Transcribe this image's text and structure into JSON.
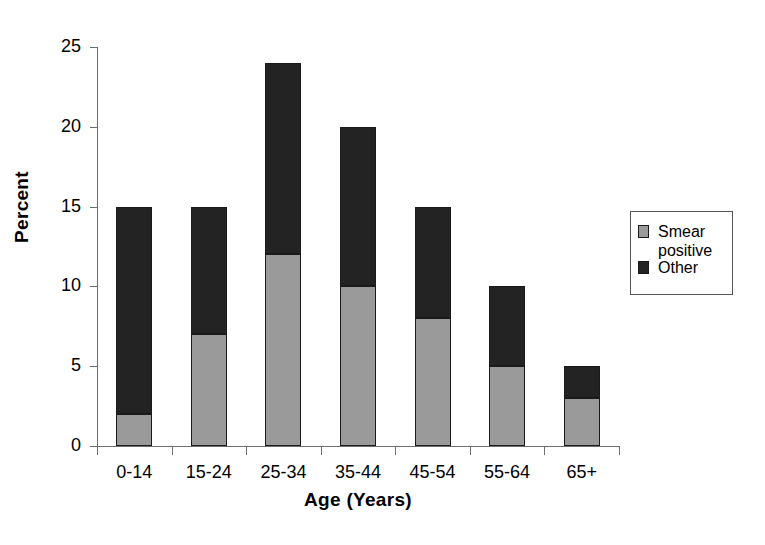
{
  "chart_data": {
    "type": "bar",
    "subtype": "stacked-vertical",
    "title": "",
    "xlabel": "Age (Years)",
    "ylabel": "Percent",
    "categories": [
      "0-14",
      "15-24",
      "25-34",
      "35-44",
      "45-54",
      "55-64",
      "65+"
    ],
    "series": [
      {
        "name": "Smear positive",
        "color": "#9a9a9a",
        "values": [
          2,
          7,
          12,
          10,
          8,
          5,
          3
        ]
      },
      {
        "name": "Other",
        "color": "#232323",
        "values": [
          13,
          8,
          12,
          10,
          7,
          5,
          2
        ]
      }
    ],
    "totals": [
      15,
      15,
      24,
      20,
      15,
      10,
      5
    ],
    "ylim": [
      0,
      25
    ],
    "yticks": [
      0,
      5,
      10,
      15,
      20,
      25
    ],
    "ytick_labels": [
      "0",
      "5",
      "10",
      "15",
      "20",
      "25"
    ],
    "grid": false,
    "legend_position": "right"
  },
  "axes": {
    "y_title": "Percent",
    "x_title": "Age (Years)"
  },
  "legend": {
    "entries": [
      {
        "label": "Smear\npositive",
        "color": "#9a9a9a"
      },
      {
        "label": "Other",
        "color": "#232323"
      }
    ]
  },
  "colors": {
    "smear_positive": "#9a9a9a",
    "other": "#232323",
    "axis": "#6e6e6e",
    "bar_outline": "#1a1a1a",
    "background": "#ffffff"
  }
}
